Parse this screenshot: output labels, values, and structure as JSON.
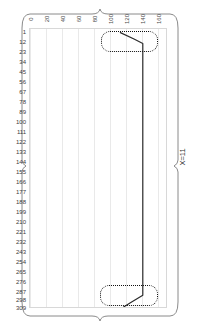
{
  "chart_data": {
    "type": "line",
    "title": "",
    "subtitle": "",
    "xlabel": "",
    "ylabel": "",
    "annotation_right": "X=11",
    "grid": true,
    "grid_axis": "x",
    "legend": "none",
    "xlim": [
      0,
      170
    ],
    "ylim": [
      309,
      1
    ],
    "y_inverted": true,
    "xticks": [
      0,
      20,
      40,
      60,
      80,
      100,
      120,
      140,
      160
    ],
    "xticklabels": [
      "0",
      "20",
      "40",
      "60",
      "80",
      "100",
      "120",
      "140",
      "160"
    ],
    "yticks": [
      1,
      12,
      23,
      34,
      45,
      56,
      67,
      78,
      89,
      100,
      111,
      122,
      133,
      144,
      155,
      166,
      177,
      188,
      199,
      210,
      221,
      232,
      243,
      254,
      265,
      276,
      287,
      298,
      309
    ],
    "yticklabels": [
      "1",
      "12",
      "23",
      "34",
      "45",
      "56",
      "67",
      "78",
      "89",
      "100",
      "111",
      "122",
      "133",
      "144",
      "155",
      "166",
      "177",
      "188",
      "199",
      "210",
      "221",
      "232",
      "243",
      "254",
      "265",
      "276",
      "287",
      "298",
      "309"
    ],
    "series": [
      {
        "name": "trace",
        "color": "#2b2b2b",
        "x": [
          117,
          126,
          141,
          141,
          141,
          141,
          141,
          141,
          141,
          141,
          141,
          141,
          141,
          141,
          141,
          141,
          141,
          141,
          141,
          141,
          141,
          141,
          141,
          141,
          141,
          141,
          141,
          141,
          141,
          130,
          113
        ],
        "y": [
          1,
          6,
          14,
          23,
          34,
          45,
          56,
          67,
          78,
          89,
          100,
          111,
          122,
          133,
          144,
          155,
          166,
          177,
          188,
          199,
          210,
          221,
          232,
          243,
          254,
          265,
          276,
          287,
          293,
          298,
          305
        ]
      }
    ],
    "annotations": [
      {
        "name": "highlight-region-top",
        "shape": "dotted-rounded-rect",
        "x_range": [
          100,
          166
        ],
        "y_range": [
          1,
          24
        ],
        "color": "#111111"
      },
      {
        "name": "highlight-region-bottom",
        "shape": "dotted-rounded-rect",
        "x_range": [
          99,
          166
        ],
        "y_range": [
          287,
          309
        ],
        "color": "#111111"
      }
    ]
  },
  "colors": {
    "line": "#2b2b2b",
    "grid": "#e9e9e9",
    "axis_text": "#3b3b3b",
    "frame": "#8a8a8a",
    "highlight": "#111111",
    "background": "#ffffff"
  },
  "frame": {
    "style": "curly-brace",
    "name": "panel-brace-frame"
  }
}
